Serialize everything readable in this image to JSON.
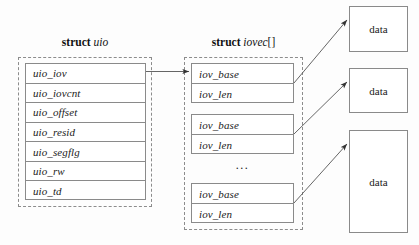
{
  "diagram": {
    "title_uio": {
      "keyword": "struct",
      "name": "uio"
    },
    "title_iovec": {
      "keyword": "struct",
      "name": "iovec",
      "brackets": "[]"
    },
    "uio_fields": [
      "uio_iov",
      "uio_iovcnt",
      "uio_offset",
      "uio_resid",
      "uio_segflg",
      "uio_rw",
      "uio_td"
    ],
    "iovec_groups": [
      {
        "fields": [
          "iov_base",
          "iov_len"
        ]
      },
      {
        "fields": [
          "iov_base",
          "iov_len"
        ]
      },
      {
        "fields": [
          "iov_base",
          "iov_len"
        ]
      }
    ],
    "ellipsis": "...",
    "data_blocks": [
      {
        "label": "data"
      },
      {
        "label": "data"
      },
      {
        "label": "data"
      }
    ],
    "colors": {
      "background": "#fdfdfd",
      "solid_border": "#8a8a8a",
      "dashed_border": "#8c8c8c",
      "arrow": "#555555",
      "text": "#1a1a1a"
    }
  }
}
